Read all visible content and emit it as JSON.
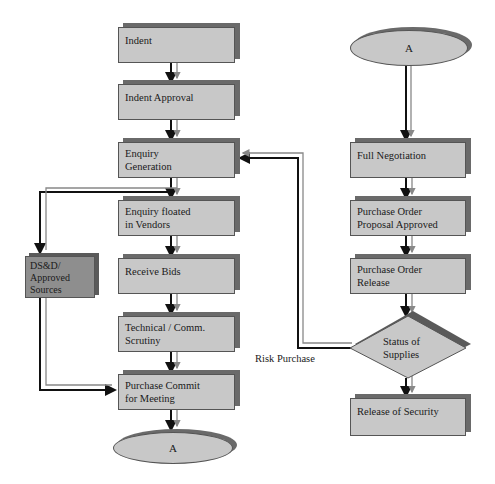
{
  "diagram": {
    "type": "flowchart",
    "left_column": {
      "nodes": [
        {
          "id": "indent",
          "label": "Indent",
          "shape": "rectangle"
        },
        {
          "id": "indent-approval",
          "label": "Indent Approval",
          "shape": "rectangle"
        },
        {
          "id": "enquiry-generation",
          "label": "Enquiry Generation",
          "lines": [
            "Enquiry",
            "Generation"
          ],
          "shape": "rectangle"
        },
        {
          "id": "enquiry-floated",
          "label": "Enquiry floated in Vendors",
          "lines": [
            "Enquiry floated",
            "in Vendors"
          ],
          "shape": "rectangle"
        },
        {
          "id": "receive-bids",
          "label": "Receive Bids",
          "shape": "rectangle"
        },
        {
          "id": "technical-scrutiny",
          "label": "Technical / Comm. Scrutiny",
          "lines": [
            "Technical / Comm.",
            "Scrutiny"
          ],
          "shape": "rectangle"
        },
        {
          "id": "purchase-commit",
          "label": "Purchase Commit for Meeting",
          "lines": [
            "Purchase Commit",
            "for Meeting"
          ],
          "shape": "rectangle"
        },
        {
          "id": "connector-a-bottom",
          "label": "A",
          "shape": "ellipse"
        }
      ]
    },
    "side_node": {
      "id": "dsd-sources",
      "label": "DS&D/ Approved Sources",
      "lines": [
        "DS&D/",
        "Approved",
        "Sources"
      ],
      "shape": "rectangle-dark"
    },
    "right_column": {
      "nodes": [
        {
          "id": "connector-a-top",
          "label": "A",
          "shape": "ellipse"
        },
        {
          "id": "full-negotiation",
          "label": "Full Negotiation",
          "shape": "rectangle"
        },
        {
          "id": "po-proposal-approved",
          "label": "Purchase Order Proposal Approved",
          "lines": [
            "Purchase Order",
            "Proposal Approved"
          ],
          "shape": "rectangle"
        },
        {
          "id": "po-release",
          "label": "Purchase Order Release",
          "lines": [
            "Purchase Order",
            "Release"
          ],
          "shape": "rectangle"
        },
        {
          "id": "status-of-supplies",
          "label": "Status of Supplies",
          "lines": [
            "Status of",
            "Supplies"
          ],
          "shape": "diamond"
        },
        {
          "id": "release-of-security",
          "label": "Release of Security",
          "shape": "rectangle"
        }
      ]
    },
    "edge_labels": {
      "risk_purchase": "Risk Purchase"
    },
    "edges": [
      {
        "from": "indent",
        "to": "indent-approval"
      },
      {
        "from": "indent-approval",
        "to": "enquiry-generation"
      },
      {
        "from": "enquiry-generation",
        "to": "enquiry-floated"
      },
      {
        "from": "enquiry-generation",
        "to": "dsd-sources"
      },
      {
        "from": "enquiry-floated",
        "to": "receive-bids"
      },
      {
        "from": "receive-bids",
        "to": "technical-scrutiny"
      },
      {
        "from": "technical-scrutiny",
        "to": "purchase-commit"
      },
      {
        "from": "dsd-sources",
        "to": "purchase-commit"
      },
      {
        "from": "purchase-commit",
        "to": "connector-a-bottom"
      },
      {
        "from": "connector-a-top",
        "to": "full-negotiation"
      },
      {
        "from": "full-negotiation",
        "to": "po-proposal-approved"
      },
      {
        "from": "po-proposal-approved",
        "to": "po-release"
      },
      {
        "from": "po-release",
        "to": "status-of-supplies"
      },
      {
        "from": "status-of-supplies",
        "to": "release-of-security"
      },
      {
        "from": "status-of-supplies",
        "to": "enquiry-generation",
        "label": "Risk Purchase"
      }
    ],
    "colors": {
      "box_fill": "#c8c8c8",
      "box_shadow": "#6a6a6a",
      "dark_box_fill": "#8e8e8e",
      "arrow_dark": "#111111",
      "arrow_light": "#888888"
    }
  }
}
